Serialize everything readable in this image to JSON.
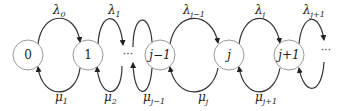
{
  "diagram": {
    "type": "birth-death-process-state-diagram",
    "nodes": [
      {
        "id": "n0",
        "label": "0",
        "cx": 28
      },
      {
        "id": "n1",
        "label": "1",
        "cx": 88
      },
      {
        "id": "n-jm1",
        "label": "j−1",
        "cx": 160
      },
      {
        "id": "n-j",
        "label": "j",
        "cx": 229
      },
      {
        "id": "n-jp1",
        "label": "j+1",
        "cx": 289
      }
    ],
    "ellipsis": [
      "···",
      "···"
    ],
    "birth_rates": [
      {
        "base": "λ",
        "sub": "0"
      },
      {
        "base": "λ",
        "sub": "1"
      },
      {
        "base": "λ",
        "sub": "j−1"
      },
      {
        "base": "λ",
        "sub": "j"
      },
      {
        "base": "λ",
        "sub": "j+1"
      }
    ],
    "death_rates": [
      {
        "base": "μ",
        "sub": "1"
      },
      {
        "base": "μ",
        "sub": "2"
      },
      {
        "base": "μ",
        "sub": "j−1"
      },
      {
        "base": "μ",
        "sub": "j"
      },
      {
        "base": "μ",
        "sub": "j+1"
      }
    ]
  }
}
